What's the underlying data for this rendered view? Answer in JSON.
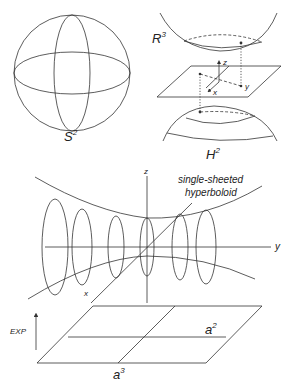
{
  "figure": {
    "sphere": {
      "label_base": "S",
      "label_exp": "2"
    },
    "ambient": {
      "label_base": "R",
      "label_exp": "3"
    },
    "hyperbolic": {
      "label_base": "H",
      "label_exp": "2"
    },
    "plane_axes": {
      "x": "x",
      "y": "y",
      "z": "z"
    },
    "hyperboloid": {
      "caption_line1": "single-sheeted",
      "caption_line2": "hyperboloid",
      "axes": {
        "x": "x",
        "y": "y",
        "z": "z"
      }
    },
    "exp_map": {
      "label": "EXP"
    },
    "lie_algebra": {
      "a2_base": "a",
      "a2_exp": "2",
      "a3_base": "a",
      "a3_exp": "3"
    }
  },
  "colors": {
    "line": "#333333",
    "text": "#222222",
    "background": "#ffffff"
  }
}
